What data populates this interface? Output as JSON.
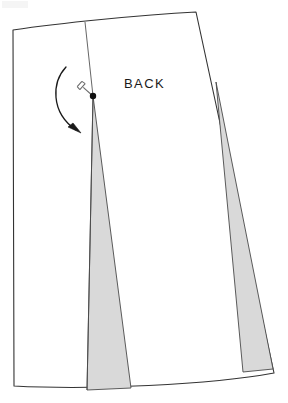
{
  "diagram": {
    "kind": "sewing-pattern-schematic",
    "title_label": "BACK",
    "background_color": "#ffffff",
    "outline_color": "#333333",
    "outline_width": 1.1,
    "dart_fill_color": "#d9d9d9",
    "dart_stroke_color": "#4a4a4a",
    "pivot_color": "#111111",
    "arrow_color": "#1a1a1a",
    "pin_color": "#6b6b6b"
  },
  "pattern_piece": {
    "name": "skirt-back",
    "label": "BACK",
    "outline_points": {
      "top_left": [
        13,
        30
      ],
      "top_right": [
        196,
        12
      ],
      "bottom_right": [
        274,
        373
      ],
      "bottom_left": [
        14,
        386
      ]
    },
    "edges": [
      {
        "name": "waist-edge-top",
        "type": "curve",
        "from": [
          13,
          30
        ],
        "to": [
          196,
          12
        ]
      },
      {
        "name": "side-seam-right",
        "type": "line",
        "from": [
          196,
          12
        ],
        "to": [
          274,
          373
        ]
      },
      {
        "name": "hem-edge-bottom",
        "type": "curve",
        "from": [
          274,
          373
        ],
        "to": [
          14,
          386
        ]
      },
      {
        "name": "center-back-left",
        "type": "line",
        "from": [
          14,
          386
        ],
        "to": [
          13,
          30
        ]
      }
    ]
  },
  "darts": [
    {
      "name": "left-dart",
      "label": "",
      "apex": [
        93,
        96
      ],
      "base_left": [
        87,
        390
      ],
      "base_right": [
        131,
        388
      ],
      "fill": "#d9d9d9"
    },
    {
      "name": "right-dart",
      "label": "",
      "apex": [
        216,
        82
      ],
      "base_left": [
        243,
        372
      ],
      "base_right": [
        273,
        369
      ],
      "fill": "#d9d9d9"
    }
  ],
  "markings": {
    "pivot_point": {
      "name": "pivot-point",
      "position": [
        93,
        96
      ],
      "radius": 3.2
    },
    "slash_line": {
      "name": "slash-line",
      "from": [
        85,
        22
      ],
      "to": [
        93,
        96
      ]
    },
    "pin": {
      "name": "pin-marker",
      "position": [
        84,
        87
      ],
      "angle_deg": 42
    },
    "rotation_arrow": {
      "name": "rotation-arrow",
      "start": [
        66,
        67
      ],
      "control": [
        52,
        108
      ],
      "end": [
        80,
        132
      ],
      "direction": "clockwise-down"
    }
  }
}
